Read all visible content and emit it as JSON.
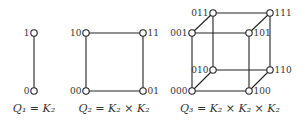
{
  "graphs": [
    {
      "id": "q1",
      "caption": "Q₁ = K₂",
      "vertices": [
        {
          "label": "1"
        },
        {
          "label": "0"
        }
      ],
      "edges": [
        [
          "1",
          "0"
        ]
      ]
    },
    {
      "id": "q2",
      "caption": "Q₂ = K₂ × K₂",
      "vertices": [
        {
          "label": "10"
        },
        {
          "label": "11"
        },
        {
          "label": "00"
        },
        {
          "label": "01"
        }
      ],
      "edges": [
        [
          "10",
          "11"
        ],
        [
          "11",
          "01"
        ],
        [
          "01",
          "00"
        ],
        [
          "00",
          "10"
        ]
      ]
    },
    {
      "id": "q3",
      "caption": "Q₃ = K₂ × K₂ × K₂",
      "vertices": [
        {
          "label": "011"
        },
        {
          "label": "111"
        },
        {
          "label": "001"
        },
        {
          "label": "101"
        },
        {
          "label": "010"
        },
        {
          "label": "110"
        },
        {
          "label": "000"
        },
        {
          "label": "100"
        }
      ],
      "edges": [
        [
          "011",
          "111"
        ],
        [
          "001",
          "101"
        ],
        [
          "010",
          "110"
        ],
        [
          "000",
          "100"
        ],
        [
          "011",
          "010"
        ],
        [
          "111",
          "110"
        ],
        [
          "001",
          "000"
        ],
        [
          "101",
          "100"
        ],
        [
          "001",
          "011"
        ],
        [
          "101",
          "111"
        ],
        [
          "000",
          "010"
        ],
        [
          "100",
          "110"
        ]
      ]
    }
  ]
}
